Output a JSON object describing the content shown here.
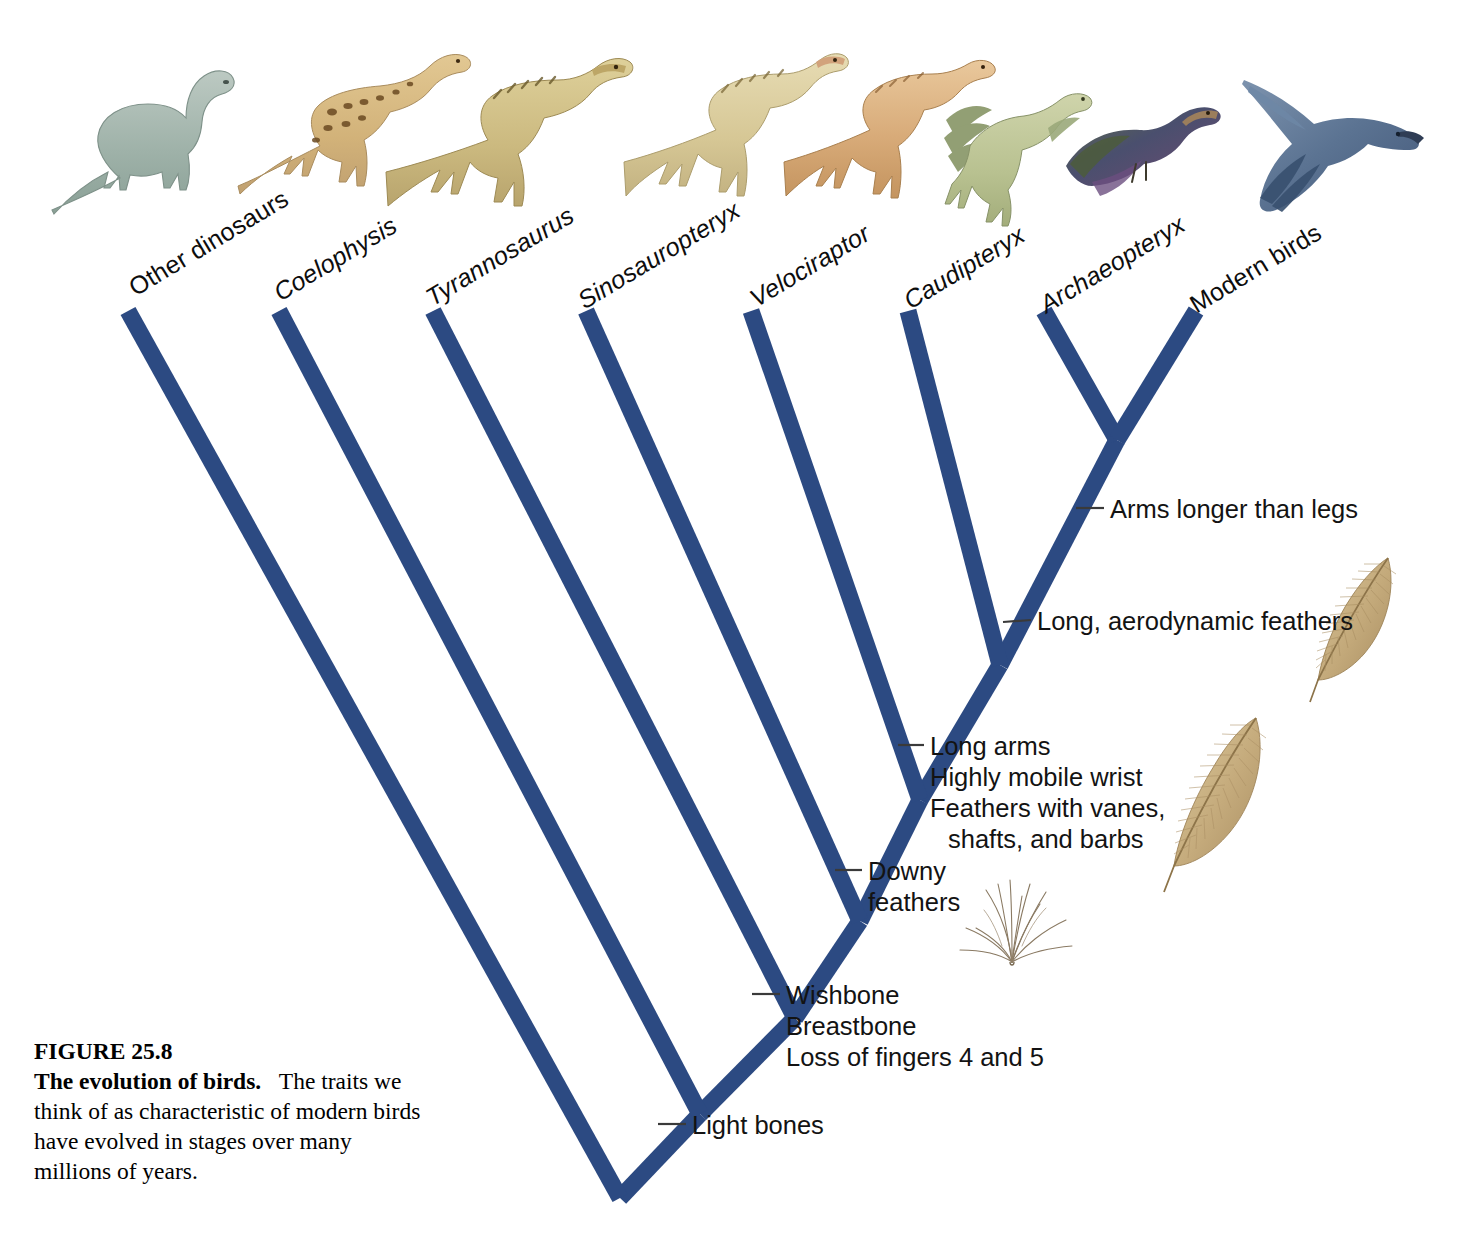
{
  "figure": {
    "number": "FIGURE 25.8",
    "title": "The evolution of birds.",
    "body": "The traits we think of as characteristic of modern birds have evolved in stages over many millions of years."
  },
  "colors": {
    "branch_blue": "#2c4a82",
    "leader_line": "#3a3a3a",
    "feather_tan": "#c4a878",
    "background": "#ffffff"
  },
  "diagram": {
    "type": "cladogram",
    "orientation": "root-at-bottom, tips-at-top",
    "taxa": [
      {
        "id": "other-dinosaurs",
        "label": "Other dinosaurs",
        "italic": false,
        "tip_x": 128,
        "tip_y": 311
      },
      {
        "id": "coelophysis",
        "label": "Coelophysis",
        "italic": true,
        "tip_x": 279,
        "tip_y": 311
      },
      {
        "id": "tyrannosaurus",
        "label": "Tyrannosaurus",
        "italic": true,
        "tip_x": 433,
        "tip_y": 311
      },
      {
        "id": "sinosauropteryx",
        "label": "Sinosauropteryx",
        "italic": true,
        "tip_x": 586,
        "tip_y": 311
      },
      {
        "id": "velociraptor",
        "label": "Velociraptor",
        "italic": true,
        "tip_x": 751,
        "tip_y": 311
      },
      {
        "id": "caudipteryx",
        "label": "Caudipteryx",
        "italic": true,
        "tip_x": 908,
        "tip_y": 311
      },
      {
        "id": "archaeopteryx",
        "label": "Archaeopteryx",
        "italic": true,
        "tip_x": 1044,
        "tip_y": 311
      },
      {
        "id": "modern-birds",
        "label": "Modern birds",
        "italic": false,
        "tip_x": 1196,
        "tip_y": 311
      }
    ],
    "nodes": [
      {
        "id": "root",
        "x": 620,
        "y": 1198,
        "joins": [
          "other-dinosaurs",
          "node-coelophysis"
        ]
      },
      {
        "id": "node-coelophysis",
        "x": 700,
        "y": 1114,
        "joins": [
          "coelophysis",
          "node-tyrannosaurus"
        ]
      },
      {
        "id": "node-tyranno",
        "x": 795,
        "y": 1018,
        "joins": [
          "tyrannosaurus",
          "node-sinosauropteryx"
        ]
      },
      {
        "id": "node-sino",
        "x": 860,
        "y": 921,
        "joins": [
          "sinosauropteryx",
          "node-velociraptor"
        ]
      },
      {
        "id": "node-veloci",
        "x": 920,
        "y": 800,
        "joins": [
          "velociraptor",
          "node-caudipteryx"
        ]
      },
      {
        "id": "node-caudi",
        "x": 1000,
        "y": 665,
        "joins": [
          "caudipteryx",
          "node-archaeopteryx"
        ]
      },
      {
        "id": "node-archaeo",
        "x": 1117,
        "y": 440,
        "joins": [
          "archaeopteryx",
          "modern-birds"
        ]
      }
    ],
    "traits": [
      {
        "id": "arms-longer-than-legs",
        "lines": [
          "Arms longer than legs"
        ],
        "anchor_x": 1076,
        "anchor_y": 508,
        "label_x": 1110,
        "label_y": 494
      },
      {
        "id": "long-aerodynamic-feathers",
        "lines": [
          "Long, aerodynamic feathers"
        ],
        "anchor_x": 1003,
        "anchor_y": 622,
        "label_x": 1037,
        "label_y": 606
      },
      {
        "id": "long-arms-mobile-wrist-feathers",
        "lines": [
          "Long arms",
          "Highly mobile wrist",
          "Feathers with vanes,",
          "shafts, and barbs"
        ],
        "anchor_x": 898,
        "anchor_y": 745,
        "label_x": 930,
        "label_y": 731
      },
      {
        "id": "downy-feathers",
        "lines": [
          "Downy",
          "feathers"
        ],
        "anchor_x": 835,
        "anchor_y": 870,
        "label_x": 868,
        "label_y": 856
      },
      {
        "id": "wishbone-breastbone-fingers",
        "lines": [
          "Wishbone",
          "Breastbone",
          "Loss of fingers 4 and 5"
        ],
        "anchor_x": 752,
        "anchor_y": 994,
        "label_x": 786,
        "label_y": 980
      },
      {
        "id": "light-bones",
        "lines": [
          "Light bones"
        ],
        "anchor_x": 658,
        "anchor_y": 1124,
        "label_x": 692,
        "label_y": 1110
      }
    ],
    "art": [
      {
        "id": "sauropod-illustration",
        "for": "other-dinosaurs",
        "kind": "sauropod"
      },
      {
        "id": "coelophysis-illustration",
        "for": "coelophysis",
        "kind": "theropod-spotted"
      },
      {
        "id": "tyrannosaurus-illustration",
        "for": "tyrannosaurus",
        "kind": "theropod-large"
      },
      {
        "id": "sinosauropteryx-illustration",
        "for": "sinosauropteryx",
        "kind": "theropod-striped"
      },
      {
        "id": "velociraptor-illustration",
        "for": "velociraptor",
        "kind": "theropod-rust"
      },
      {
        "id": "caudipteryx-illustration",
        "for": "caudipteryx",
        "kind": "feathered-theropod"
      },
      {
        "id": "archaeopteryx-illustration",
        "for": "archaeopteryx",
        "kind": "archaeopteryx"
      },
      {
        "id": "modern-bird-illustration",
        "for": "modern-birds",
        "kind": "flying-bird"
      },
      {
        "id": "pennaceous-feather-upper",
        "for": "long-aerodynamic-feathers",
        "kind": "feather"
      },
      {
        "id": "pennaceous-feather-lower",
        "for": "long-arms-mobile-wrist-feathers",
        "kind": "feather"
      },
      {
        "id": "downy-feather-tuft",
        "for": "downy-feathers",
        "kind": "down-tuft"
      }
    ]
  }
}
